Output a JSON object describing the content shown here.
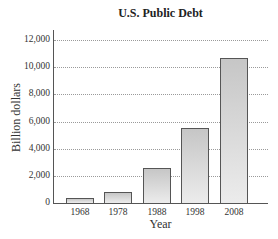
{
  "chart_data": {
    "type": "bar",
    "title": "U.S. Public Debt",
    "xlabel": "Year",
    "ylabel": "Billion dollars",
    "categories": [
      "1968",
      "1978",
      "1988",
      "1998",
      "2008"
    ],
    "values": [
      370,
      830,
      2600,
      5500,
      10700
    ],
    "ylim": [
      0,
      12000
    ],
    "yticks": [
      "0",
      "2,000",
      "4,000",
      "6,000",
      "8,000",
      "10,000",
      "12,000"
    ],
    "grid": true,
    "legend": null,
    "colors": {
      "bar_fill_top": "#c6c6c6",
      "bar_fill_bottom": "#ececec",
      "bar_border": "#555555",
      "grid": "#9a9a9a"
    }
  }
}
